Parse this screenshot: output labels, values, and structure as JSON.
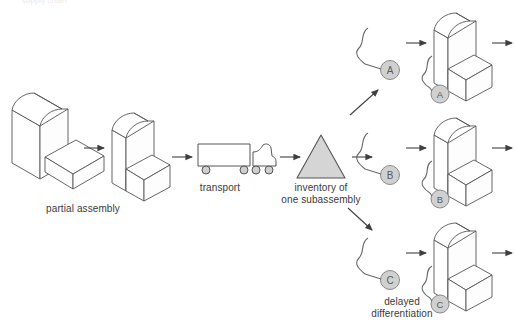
{
  "diagram": {
    "title_cut_off": "supply chain",
    "labels": {
      "partial_assembly": "partial assembly",
      "transport": "transport",
      "inventory": "inventory of\none subassembly",
      "delayed_differentiation": "delayed\ndifferentiation"
    },
    "variants": [
      {
        "id": "A",
        "tag_label": "A",
        "chair_tag_label": "A"
      },
      {
        "id": "B",
        "tag_label": "B",
        "chair_tag_label": "B"
      },
      {
        "id": "C",
        "tag_label": "C",
        "chair_tag_label": "C"
      }
    ],
    "colors": {
      "stroke": "#555555",
      "line": "#3f3f3f",
      "fill_shape": "#ffffff",
      "fill_gray": "#d5d5d5",
      "tag_fill": "#d0d0d0",
      "tag_stroke": "#8a8a8a",
      "tag_text": "#5a5a5a",
      "text": "#3a3a3a",
      "background": "#ffffff"
    }
  }
}
